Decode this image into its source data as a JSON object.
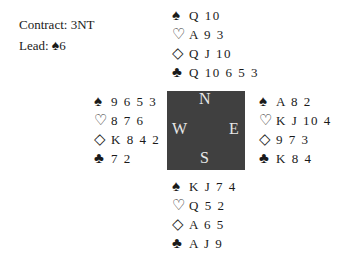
{
  "info": {
    "contract_label": "Contract: 3NT",
    "lead_prefix": "Lead: ",
    "lead_suit": "♠",
    "lead_card": "6"
  },
  "suits": {
    "spades": "♠",
    "hearts": "♡",
    "diamonds": "◇",
    "clubs": "♣"
  },
  "hands": {
    "north": {
      "spades": "Q 10",
      "hearts": "A 9 3",
      "diamonds": "Q J 10",
      "clubs": "Q 10 6 5 3"
    },
    "west": {
      "spades": "9 6 5 3",
      "hearts": "8 7 6",
      "diamonds": "K 8 4 2",
      "clubs": "7 2"
    },
    "east": {
      "spades": "A 8 2",
      "hearts": "K J 10 4",
      "diamonds": "9 7 3",
      "clubs": "K 8 4"
    },
    "south": {
      "spades": "K J 7 4",
      "hearts": "Q 5 2",
      "diamonds": "A 6 5",
      "clubs": "A J 9"
    }
  },
  "compass": {
    "n": "N",
    "s": "S",
    "e": "E",
    "w": "W"
  },
  "colors": {
    "compass_bg": "#404040",
    "compass_text": "#e8e8e8",
    "text": "#1a1a1a"
  }
}
